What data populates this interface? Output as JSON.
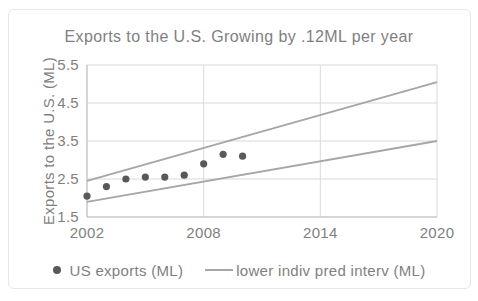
{
  "chart_data": {
    "type": "scatter",
    "title": "Exports to the U.S. Growing by .12ML per year",
    "xlabel": "",
    "ylabel": "Exports to the U.S. (ML)",
    "xlim": [
      2002,
      2020
    ],
    "ylim": [
      1.5,
      5.5
    ],
    "xticks": [
      2002,
      2008,
      2014,
      2020
    ],
    "yticks": [
      1.5,
      2.5,
      3.5,
      4.5,
      5.5
    ],
    "grid": true,
    "legend_position": "bottom-center",
    "colors": {
      "text": "#7f7f7f",
      "grid": "#d9d9d9",
      "axis": "#bfbfbf",
      "line": "#a6a6a6",
      "marker": "#595959",
      "background": "#ffffff",
      "frame_border": "#e7e7e7"
    },
    "series": [
      {
        "id": "us-exports",
        "name": "US exports (ML)",
        "type": "scatter",
        "marker": "circle",
        "color": "#595959",
        "x": [
          2002,
          2003,
          2004,
          2005,
          2006,
          2007,
          2008,
          2009,
          2010
        ],
        "y": [
          2.05,
          2.3,
          2.5,
          2.55,
          2.55,
          2.6,
          2.9,
          3.15,
          3.1
        ],
        "in_legend": true
      },
      {
        "id": "upper-pred-interval",
        "type": "line",
        "color": "#a6a6a6",
        "x": [
          2002,
          2020
        ],
        "y": [
          2.45,
          5.05
        ],
        "in_legend": false
      },
      {
        "id": "lower-pred-interval",
        "name": "lower indiv pred interv (ML)",
        "type": "line",
        "color": "#a6a6a6",
        "x": [
          2002,
          2020
        ],
        "y": [
          1.9,
          3.5
        ],
        "in_legend": true
      }
    ]
  },
  "legend": {
    "items": [
      {
        "label": "US exports (ML)",
        "marker": "dot"
      },
      {
        "label": "lower indiv pred interv (ML)",
        "marker": "line"
      }
    ]
  }
}
